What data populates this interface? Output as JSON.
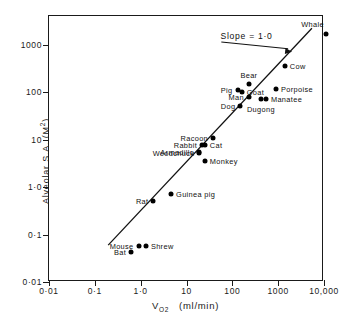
{
  "chart_data": {
    "type": "scatter",
    "title": "",
    "xlabel": "V O2 (ml/min)",
    "ylabel": "Alveolar S.A. (M2)",
    "xlabel_main": "V",
    "xlabel_sub": "O",
    "xlabel_sub2": "2",
    "xlabel_units": "(ml/min)",
    "ylabel_text": "Alveolar S.A. (M",
    "ylabel_sup": "2",
    "ylabel_tail": ")",
    "xscale": "log",
    "yscale": "log",
    "xlim": [
      0.01,
      10000
    ],
    "ylim": [
      0.01,
      4000
    ],
    "grid": false,
    "legend": "none",
    "xticks": [
      {
        "value": 0.01,
        "label": "0·01"
      },
      {
        "value": 0.1,
        "label": "0·1"
      },
      {
        "value": 1,
        "label": "1·0"
      },
      {
        "value": 10,
        "label": "10"
      },
      {
        "value": 100,
        "label": "100"
      },
      {
        "value": 1000,
        "label": "1000"
      },
      {
        "value": 10000,
        "label": "10,000"
      }
    ],
    "yticks": [
      {
        "value": 1000,
        "label": "1000"
      },
      {
        "value": 100,
        "label": "100"
      },
      {
        "value": 10,
        "label": "10"
      },
      {
        "value": 1,
        "label": "1·0"
      },
      {
        "value": 0.1,
        "label": "0·1"
      },
      {
        "value": 0.01,
        "label": "0·01"
      }
    ],
    "annotations": [
      {
        "text": "Slope = 1·0",
        "x": 250,
        "y": 1500
      }
    ],
    "fit_line": {
      "slope": 1.0,
      "x_start": 0.2,
      "y_start": 0.055,
      "x_end": 6000,
      "y_end": 2200
    },
    "points": [
      {
        "name": "Shrew",
        "x": 1.3,
        "y": 0.056,
        "label": "Shrew",
        "label_side": "right"
      },
      {
        "name": "Mouse",
        "x": 0.9,
        "y": 0.056,
        "label": "Mouse",
        "label_side": "left"
      },
      {
        "name": "Bat",
        "x": 0.62,
        "y": 0.043,
        "label": "Bat",
        "label_side": "left"
      },
      {
        "name": "Rat",
        "x": 1.9,
        "y": 0.5,
        "label": "Rat",
        "label_side": "left"
      },
      {
        "name": "Guinea pig",
        "x": 4.6,
        "y": 0.72,
        "label": "Guinea  pig",
        "label_side": "right"
      },
      {
        "name": "Woodchuck",
        "x": 19,
        "y": 5.1,
        "label": "Woodchuck",
        "label_side": "left"
      },
      {
        "name": "Armadillo",
        "x": 19,
        "y": 5.6,
        "label": "Armadillo",
        "label_side": "left"
      },
      {
        "name": "Rabbit",
        "x": 22,
        "y": 7.8,
        "label": "Rabbit",
        "label_side": "left"
      },
      {
        "name": "Cat",
        "x": 25,
        "y": 7.8,
        "label": "Cat",
        "label_side": "right"
      },
      {
        "name": "Monkey",
        "x": 25,
        "y": 3.6,
        "label": "Monkey",
        "label_side": "right"
      },
      {
        "name": "Racoon",
        "x": 38,
        "y": 11,
        "label": "Racoon",
        "label_side": "left"
      },
      {
        "name": "Dog",
        "x": 150,
        "y": 52,
        "label": "Dog",
        "label_side": "left"
      },
      {
        "name": "Pig",
        "x": 130,
        "y": 112,
        "label": "Pig",
        "label_side": "left"
      },
      {
        "name": "Goat",
        "x": 160,
        "y": 100,
        "label": "Goat",
        "label_side": "right"
      },
      {
        "name": "Bear",
        "x": 230,
        "y": 150,
        "label": "Bear",
        "label_side": "above"
      },
      {
        "name": "Man",
        "x": 230,
        "y": 80,
        "label": "Man",
        "label_side": "left"
      },
      {
        "name": "Dugong",
        "x": 420,
        "y": 72,
        "label": "Dugong",
        "label_side": "below"
      },
      {
        "name": "Manatee",
        "x": 540,
        "y": 72,
        "label": "Manatee",
        "label_side": "right"
      },
      {
        "name": "Porpoise",
        "x": 900,
        "y": 115,
        "label": "Porpoise",
        "label_side": "right"
      },
      {
        "name": "Cow",
        "x": 1400,
        "y": 360,
        "label": "Cow",
        "label_side": "right"
      },
      {
        "name": "Whale",
        "x": 11000,
        "y": 1700,
        "label": "Whale",
        "label_side": "above-left"
      }
    ]
  }
}
